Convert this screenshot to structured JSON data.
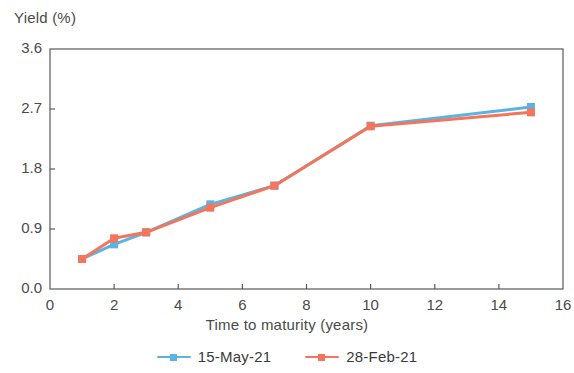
{
  "chart_data": {
    "type": "line",
    "title": "",
    "xlabel": "Time to maturity (years)",
    "ylabel": "Yield (%)",
    "xlim": [
      0,
      16
    ],
    "ylim": [
      0.0,
      3.6
    ],
    "xticks": [
      "0",
      "2",
      "4",
      "6",
      "8",
      "10",
      "12",
      "14",
      "16"
    ],
    "yticks": [
      "0.0",
      "0.9",
      "1.8",
      "2.7",
      "3.6"
    ],
    "xtick_values": [
      0,
      2,
      4,
      6,
      8,
      10,
      12,
      14,
      16
    ],
    "ytick_values": [
      0.0,
      0.9,
      1.8,
      2.7,
      3.6
    ],
    "grid": false,
    "legend_position": "bottom-center",
    "x": [
      1,
      2,
      3,
      5,
      7,
      10,
      15
    ],
    "series": [
      {
        "name": "15-May-21",
        "color": "#5BB3E4",
        "marker": "square",
        "values": [
          0.45,
          0.67,
          0.85,
          1.27,
          1.55,
          2.45,
          2.73
        ]
      },
      {
        "name": "28-Feb-21",
        "color": "#F4745C",
        "marker": "square",
        "values": [
          0.45,
          0.76,
          0.85,
          1.22,
          1.55,
          2.44,
          2.65
        ]
      }
    ]
  },
  "legend": {
    "entries": [
      {
        "label": "15-May-21"
      },
      {
        "label": "28-Feb-21"
      }
    ]
  },
  "axes": {
    "frame_color": "#595959"
  }
}
